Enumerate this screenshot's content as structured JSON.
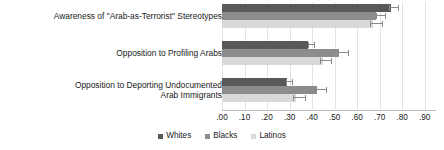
{
  "chart_data": {
    "type": "bar",
    "orientation": "horizontal",
    "title": "",
    "subtitle": "",
    "xlabel": "",
    "ylabel": "",
    "xlim": [
      0.0,
      0.95
    ],
    "grid": true,
    "legend_position": "bottom-center",
    "tick_labels": [
      ".00",
      ".10",
      ".20",
      ".30",
      ".40",
      ".50",
      ".60",
      ".70",
      ".80",
      ".90"
    ],
    "tick_values": [
      0.0,
      0.1,
      0.2,
      0.3,
      0.4,
      0.5,
      0.6,
      0.7,
      0.8,
      0.9
    ],
    "categories": [
      "Awareness of \"Arab-as-Terrorist\" Stereotypes",
      "Opposition to Profiling Arabs",
      "Opposition to Deporting Undocumented\nArab Immigrants"
    ],
    "series": [
      {
        "name": "Whites",
        "color": "#595959",
        "values": [
          0.75,
          0.38,
          0.29
        ],
        "err_low": [
          0.74,
          0.38,
          0.285
        ],
        "err_high": [
          0.785,
          0.415,
          0.315
        ]
      },
      {
        "name": "Blacks",
        "color": "#8c8c8c",
        "values": [
          0.685,
          0.52,
          0.42
        ],
        "err_low": [
          0.685,
          0.515,
          0.415
        ],
        "err_high": [
          0.73,
          0.565,
          0.465
        ]
      },
      {
        "name": "Latinos",
        "color": "#d9d9d9",
        "values": [
          0.67,
          0.45,
          0.33
        ],
        "err_low": [
          0.655,
          0.435,
          0.315
        ],
        "err_high": [
          0.715,
          0.49,
          0.375
        ]
      }
    ]
  }
}
